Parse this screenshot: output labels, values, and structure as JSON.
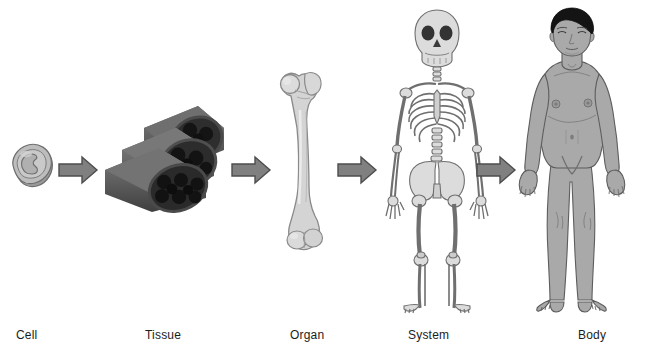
{
  "figure": {
    "background_color": "#ffffff",
    "orientation": "left-to-right sequence"
  },
  "palette": {
    "arrow_fill": "#808080",
    "arrow_stroke": "#4d4d4d",
    "cell_fill": "#b3b3b3",
    "cell_stroke": "#6e6e6e",
    "tissue_fill": "#6b6b6b",
    "tissue_dark": "#1f1f1f",
    "bone_fill": "#d6d6d6",
    "bone_stroke": "#7a7a7a",
    "skeleton_fill": "#d9d9d9",
    "skeleton_stroke": "#6b6b6b",
    "skin_fill": "#a8a8a8",
    "skin_stroke": "#5a5a5a",
    "hair_fill": "#141414",
    "label_color": "#1c1c1c"
  },
  "stages": [
    {
      "key": "cell",
      "label": "Cell",
      "icon": "cell-blob-icon",
      "label_x": 16,
      "description": "single rounded cell with nucleus"
    },
    {
      "key": "tissue",
      "label": "Tissue",
      "icon": "muscle-fiber-bundle-icon",
      "label_x": 145,
      "description": "bundle of muscle fiber tubes"
    },
    {
      "key": "organ",
      "label": "Organ",
      "icon": "femur-bone-icon",
      "label_x": 290,
      "description": "femur bone"
    },
    {
      "key": "system",
      "label": "System",
      "icon": "skeleton-icon",
      "label_x": 408,
      "description": "full human skeleton"
    },
    {
      "key": "body",
      "label": "Body",
      "icon": "human-body-icon",
      "label_x": 578,
      "description": "full human male body"
    }
  ],
  "arrows": [
    {
      "key": "cell-to-tissue",
      "from": "cell",
      "to": "tissue",
      "x": 58,
      "y": 154
    },
    {
      "key": "tissue-to-organ",
      "from": "tissue",
      "to": "organ",
      "x": 231,
      "y": 154
    },
    {
      "key": "organ-to-system",
      "from": "organ",
      "to": "system",
      "x": 337,
      "y": 154
    },
    {
      "key": "system-to-body",
      "from": "system",
      "to": "body",
      "x": 476,
      "y": 154
    }
  ],
  "labels": {
    "cell": "Cell",
    "tissue": "Tissue",
    "organ": "Organ",
    "system": "System",
    "body": "Body"
  }
}
